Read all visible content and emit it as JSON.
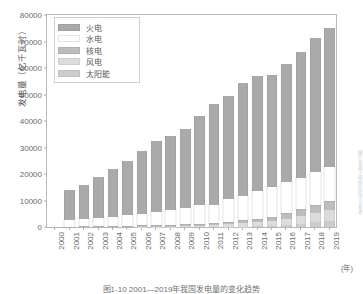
{
  "figure": {
    "caption": "图1-10  2001—2019年我国发电量的变化趋势",
    "watermark": "图片来源于网络仅供学习参考"
  },
  "axes": {
    "ylabel": "发电量（亿千瓦时）",
    "xunit": "(年)",
    "yticks": [
      "0",
      "10000",
      "20000",
      "30000",
      "40000",
      "50000",
      "60000",
      "70000",
      "80000"
    ],
    "ylim": [
      0,
      80000
    ],
    "xticks": [
      "2000",
      "2001",
      "2002",
      "2003",
      "2004",
      "2005",
      "2006",
      "2007",
      "2008",
      "2009",
      "2010",
      "2011",
      "2012",
      "2013",
      "2014",
      "2015",
      "2016",
      "2017",
      "2018",
      "2019"
    ]
  },
  "legend": {
    "items": [
      {
        "label": "火电",
        "color": "#aaaaaa"
      },
      {
        "label": "水电",
        "color": "#ffffff"
      },
      {
        "label": "核电",
        "color": "#bdbdbd"
      },
      {
        "label": "风电",
        "color": "#dcdcdc"
      },
      {
        "label": "太阳能",
        "color": "#cccccc"
      }
    ]
  },
  "chart_data": {
    "type": "bar",
    "stacked": true,
    "title": "图1-10  2001—2019年我国发电量的变化趋势",
    "xlabel": "(年)",
    "ylabel": "发电量（亿千瓦时）",
    "ylim": [
      0,
      80000
    ],
    "grid": false,
    "legend_position": "upper-left",
    "categories": [
      "2000",
      "2001",
      "2002",
      "2003",
      "2004",
      "2005",
      "2006",
      "2007",
      "2008",
      "2009",
      "2010",
      "2011",
      "2012",
      "2013",
      "2014",
      "2015",
      "2016",
      "2017",
      "2018",
      "2019"
    ],
    "series": [
      {
        "name": "火电",
        "color": "#aaaaaa",
        "values": [
          0,
          11200,
          13000,
          15500,
          18000,
          20500,
          23700,
          27000,
          27900,
          30100,
          33300,
          38300,
          38900,
          42400,
          43100,
          42300,
          44400,
          47500,
          50700,
          52200
        ]
      },
      {
        "name": "水电",
        "color": "#ffffff",
        "values": [
          0,
          2600,
          2700,
          2800,
          3300,
          3900,
          4300,
          4800,
          5600,
          6100,
          7200,
          6600,
          8600,
          9200,
          10600,
          11100,
          11800,
          11900,
          12300,
          13000
        ]
      },
      {
        "name": "核电",
        "color": "#bdbdbd",
        "values": [
          0,
          180,
          250,
          430,
          500,
          530,
          550,
          620,
          690,
          700,
          750,
          870,
          980,
          1120,
          1330,
          1710,
          2130,
          2480,
          2940,
          3500
        ]
      },
      {
        "name": "风电",
        "color": "#dcdcdc",
        "values": [
          0,
          10,
          12,
          15,
          20,
          20,
          30,
          60,
          130,
          270,
          450,
          700,
          1030,
          1410,
          1600,
          1860,
          2410,
          3050,
          3660,
          4060
        ]
      },
      {
        "name": "太阳能",
        "color": "#cccccc",
        "values": [
          0,
          0,
          0,
          0,
          0,
          0,
          0,
          0,
          0,
          0,
          10,
          10,
          40,
          80,
          230,
          390,
          660,
          1170,
          1770,
          2240
        ]
      }
    ],
    "totals": [
      0,
      13990,
      15962,
      18745,
      21820,
      24950,
      28580,
      32480,
      34320,
      37170,
      41710,
      46480,
      49550,
      54210,
      56860,
      57360,
      61400,
      66100,
      71370,
      75000
    ]
  }
}
